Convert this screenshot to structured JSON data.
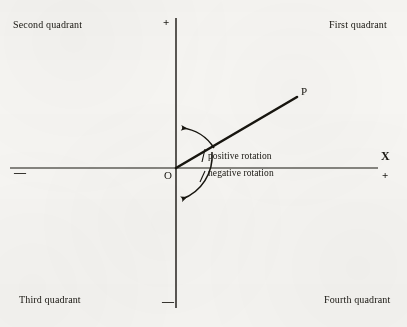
{
  "figure": {
    "background_color": "#f7f6f3",
    "ink_color": "#17150f"
  },
  "quadrants": {
    "second": "Second quadrant",
    "first": "First quadrant",
    "third": "Third quadrant",
    "fourth": "Fourth quadrant"
  },
  "axes": {
    "x_name": "X",
    "x_positive_sign": "+",
    "x_negative_sign": "—",
    "y_positive_sign": "+",
    "y_negative_sign": "—"
  },
  "points": {
    "origin_label": "O",
    "terminal_label": "P"
  },
  "rotation": {
    "positive_label": "positive rotation",
    "negative_label": "negative rotation"
  },
  "geometry": {
    "origin_x": 176,
    "origin_y": 168,
    "ray_end_x": 297,
    "ray_end_y": 97,
    "ray_angle_degrees": 30,
    "x_axis_left": 10,
    "x_axis_right": 378,
    "y_axis_top": 18,
    "y_axis_bottom": 308
  }
}
